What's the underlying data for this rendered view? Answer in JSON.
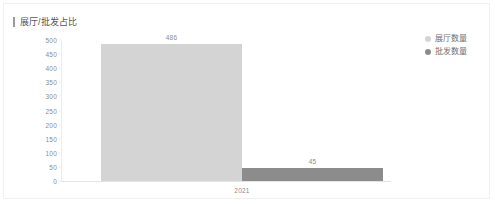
{
  "card": {
    "title": "展厅/批发占比",
    "accent_color": "#9a9a9a",
    "border_color": "#f0f0f0",
    "background": "#ffffff"
  },
  "legend": {
    "position": "top-right",
    "items": [
      {
        "label": "展厅数量",
        "color": "#d4d4d4",
        "icon": "legend-dot-icon"
      },
      {
        "label": "批发数量",
        "color": "#8c8c8c",
        "icon": "legend-dot-icon"
      }
    ]
  },
  "chart_data": {
    "type": "bar",
    "title": "展厅/批发占比",
    "xlabel": "",
    "ylabel": "",
    "categories": [
      "2021"
    ],
    "series": [
      {
        "name": "展厅数量",
        "values": [
          486
        ],
        "color": "#d4d4d4"
      },
      {
        "name": "批发数量",
        "values": [
          45
        ],
        "color": "#8c8c8c"
      }
    ],
    "data_labels": [
      "486",
      "45"
    ],
    "ylim": [
      0,
      500
    ],
    "ytick_step": 50,
    "yticks": [
      "500",
      "450",
      "400",
      "350",
      "300",
      "250",
      "200",
      "150",
      "100",
      "50",
      "0"
    ],
    "grid": false,
    "legend_position": "top-right"
  }
}
